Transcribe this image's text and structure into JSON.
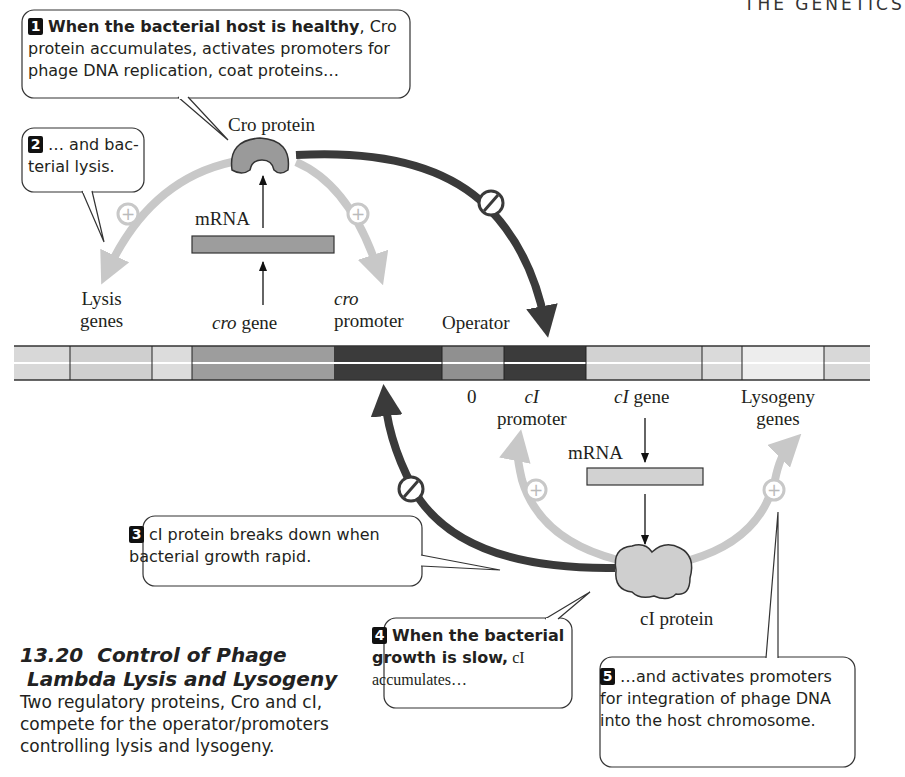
{
  "header": {
    "running_head": "THE GENETICS"
  },
  "figure": {
    "number": "13.20",
    "title_line1": "Control of Phage",
    "title_line2": "Lambda Lysis and Lysogeny",
    "caption": "Two regulatory proteins, Cro and cI, compete for the operator/promoters controlling lysis and lysogeny."
  },
  "callouts": [
    {
      "num": "1",
      "bold": "When the bacterial host is healthy",
      "text": ", Cro protein accumulates, activates promoters for phage DNA replication, coat proteins…"
    },
    {
      "num": "2",
      "bold": "",
      "text": "… and bac-terial lysis."
    },
    {
      "num": "3",
      "bold": "",
      "text": "cI protein breaks down when bacterial growth rapid."
    },
    {
      "num": "4",
      "bold": "When the bacterial growth is slow,",
      "text": " cI accumulates…"
    },
    {
      "num": "5",
      "bold": "",
      "text": "…and activates promoters for integration of phage DNA into the host chromosome."
    }
  ],
  "labels": {
    "cro_protein": "Cro protein",
    "cro_mrna": "mRNA",
    "lysis_genes_1": "Lysis",
    "lysis_genes_2": "genes",
    "cro_gene_italic": "cro",
    "cro_gene_word": "gene",
    "cro_promoter_italic": "cro",
    "cro_promoter_word": "promoter",
    "operator": "Operator",
    "zero": "0",
    "ci_promoter_italic": "cI",
    "ci_promoter_word": "promoter",
    "ci_gene_italic": "cI",
    "ci_gene_word": "gene",
    "lysogeny_genes_1": "Lysogeny",
    "lysogeny_genes_2": "genes",
    "ci_mrna": "mRNA",
    "ci_protein": "cI protein"
  },
  "symbols": {
    "activate": "+",
    "inhibit": "⊘"
  },
  "colors": {
    "dark_arrow": "#3a3a3a",
    "light_arrow": "#c8c8c8",
    "cro_protein_fill": "#9a9a9a",
    "ci_protein_fill": "#cfcfcf",
    "dna_dark": "#3b3b3b",
    "dna_mid": "#9b9b9b",
    "dna_light": "#d4d4d4",
    "dna_lighter": "#e6e6e6"
  },
  "dna_segments": [
    {
      "name": "left-end",
      "x": 0,
      "w": 42,
      "fill": "#d6d6d6"
    },
    {
      "name": "lysis-gene-a",
      "x": 42,
      "w": 28,
      "fill": "#d6d6d6"
    },
    {
      "name": "lysis-gene-b",
      "x": 70,
      "w": 82,
      "fill": "#cfcfcf"
    },
    {
      "name": "lysis-gene-c",
      "x": 152,
      "w": 40,
      "fill": "#dcdcdc"
    },
    {
      "name": "cro-gene",
      "x": 192,
      "w": 142,
      "fill": "#9d9d9d"
    },
    {
      "name": "cro-promoter",
      "x": 334,
      "w": 108,
      "fill": "#3b3b3b"
    },
    {
      "name": "operator-0",
      "x": 442,
      "w": 62,
      "fill": "#8f8f8f"
    },
    {
      "name": "ci-promoter",
      "x": 504,
      "w": 82,
      "fill": "#3b3b3b"
    },
    {
      "name": "ci-gene",
      "x": 586,
      "w": 116,
      "fill": "#d2d2d2"
    },
    {
      "name": "lysogeny-gene-a",
      "x": 702,
      "w": 40,
      "fill": "#d9d9d9"
    },
    {
      "name": "lysogeny-gene-b",
      "x": 742,
      "w": 82,
      "fill": "#ececec"
    },
    {
      "name": "right-end",
      "x": 824,
      "w": 46,
      "fill": "#d6d6d6"
    }
  ]
}
